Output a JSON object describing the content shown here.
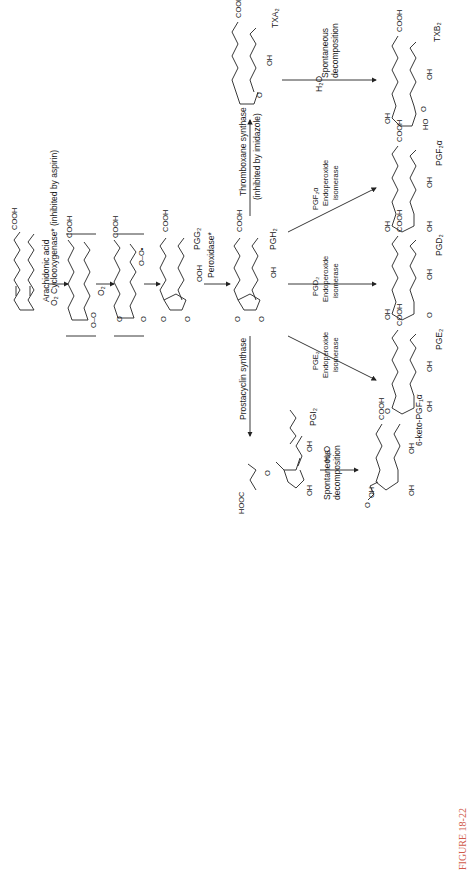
{
  "figure": {
    "caption": "FIGURE 18-22",
    "caption_color": "#d05a4a",
    "orientation": "rotated 90° counter-clockwise"
  },
  "compounds": [
    {
      "id": "arachidonic",
      "label": "Arachidonic acid",
      "group": "COOH"
    },
    {
      "id": "intermediate1",
      "label": "",
      "group": "COOH",
      "note": "O–O bridged radical (bracketed)"
    },
    {
      "id": "intermediate2",
      "label": "",
      "group": "COOH",
      "note": "O–O• peroxyl radical (bracketed)"
    },
    {
      "id": "pgg2",
      "label": "PGG",
      "sub": "2",
      "group": "COOH",
      "substituent": "OOH"
    },
    {
      "id": "pgh2",
      "label": "PGH",
      "sub": "2",
      "group": "COOH",
      "substituent": "OH"
    },
    {
      "id": "txa2",
      "label": "TXA",
      "sub": "2",
      "group": "COOH",
      "substituent": "OH"
    },
    {
      "id": "txb2",
      "label": "TXB",
      "sub": "2",
      "group": "COOH",
      "substituents": [
        "OH",
        "OH",
        "HO"
      ]
    },
    {
      "id": "pgf2a",
      "label": "PGF",
      "sub": "2α",
      "group": "COOH",
      "substituents": [
        "OH",
        "OH",
        "OH"
      ]
    },
    {
      "id": "pgd2",
      "label": "PGD",
      "sub": "2",
      "group": "COOH",
      "substituents": [
        "OH",
        "OH"
      ]
    },
    {
      "id": "pge2",
      "label": "PGE",
      "sub": "2",
      "group": "COOH",
      "substituents": [
        "OH",
        "OH"
      ]
    },
    {
      "id": "pgi2",
      "label": "PGI",
      "sub": "2",
      "group": "HOOC",
      "substituents": [
        "OH",
        "OH"
      ]
    },
    {
      "id": "keto_pgf1a",
      "label": "6-keto-PGF",
      "sub": "1α",
      "group": "COOH",
      "substituents": [
        "OH",
        "OH",
        "OH"
      ]
    }
  ],
  "reactions": [
    {
      "from": "arachidonic",
      "to": "intermediate1",
      "enzyme": "Cyclooxygenase*",
      "inhibitor": "(inhibited by aspirin)",
      "reagent": "O₂"
    },
    {
      "from": "intermediate1",
      "to": "intermediate2",
      "reagent": "O₂"
    },
    {
      "from": "intermediate2",
      "to": "pgg2"
    },
    {
      "from": "pgg2",
      "to": "pgh2",
      "enzyme": "Peroxidase*"
    },
    {
      "from": "pgh2",
      "to": "txa2",
      "enzyme": "Thromboxane synthase",
      "inhibitor": "(inhibited by imidazole)"
    },
    {
      "from": "txa2",
      "to": "txb2",
      "enzyme": "Spontaneous decomposition",
      "reagent": "H₂O"
    },
    {
      "from": "pgh2",
      "to": "pgf2a",
      "enzyme": "PGF₂α Endoperoxide isomerase"
    },
    {
      "from": "pgh2",
      "to": "pgd2",
      "enzyme": "PGD₂ Endoperoxide isomerase"
    },
    {
      "from": "pgh2",
      "to": "pge2",
      "enzyme": "PGE₂ Endoperoxide isomerase"
    },
    {
      "from": "pgh2",
      "to": "pgi2",
      "enzyme": "Prostacyclin synthase"
    },
    {
      "from": "pgi2",
      "to": "keto_pgf1a",
      "enzyme": "Spontaneous decomposition",
      "reagent": "H₂O"
    }
  ],
  "labels": {
    "arachidonic": "Arachidonic acid",
    "o2": "O₂",
    "cox": "Cyclooxygenase* (inhibited by aspirin)",
    "peroxidase": "Peroxidase*",
    "tx_synthase": "Thromboxane synthase",
    "tx_inhibitor": "(inhibited by imidazole)",
    "pc_synthase": "Prostacyclin synthase",
    "spont1": "Spontaneous",
    "spont2": "decomposition",
    "h2o": "H₂O",
    "pgf_enz1": "PGF₂α",
    "pgd_enz1": "PGD₂",
    "pge_enz1": "PGE₂",
    "endo": "Endoperoxide",
    "isomerase": "isomerase",
    "cooh": "COOH",
    "hooc": "HOOC",
    "oh": "OH",
    "ho": "HO",
    "ooh": "OOH",
    "oo": "O–O",
    "oo_rad": "O–O•",
    "o": "O",
    "pgg2": "PGG₂",
    "pgh2": "PGH₂",
    "txa2": "TXA₂",
    "txb2": "TXB₂",
    "pgf2a": "PGF₂α",
    "pgd2": "PGD₂",
    "pge2": "PGE₂",
    "pgi2": "PGI₂",
    "keto": "6-keto-PGF₁α"
  }
}
